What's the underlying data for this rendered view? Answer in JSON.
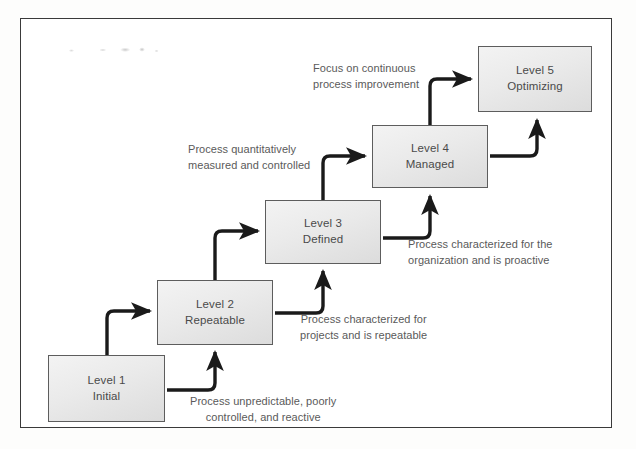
{
  "diagram": {
    "frame_color": "#3a3a3a",
    "box_fill": "#eaeaea",
    "box_border": "#5d5d5d",
    "connector_color": "#1a1a1a",
    "text_color": "#4a4a4a",
    "caption_color": "#5a5a5a"
  },
  "levels": [
    {
      "id": "level-1",
      "number": "Level 1",
      "name": "Initial",
      "x": 48,
      "y": 355,
      "w": 117,
      "h": 67
    },
    {
      "id": "level-2",
      "number": "Level 2",
      "name": "Repeatable",
      "x": 157,
      "y": 280,
      "w": 116,
      "h": 65
    },
    {
      "id": "level-3",
      "number": "Level 3",
      "name": "Defined",
      "x": 265,
      "y": 200,
      "w": 116,
      "h": 64
    },
    {
      "id": "level-4",
      "number": "Level 4",
      "name": "Managed",
      "x": 372,
      "y": 125,
      "w": 116,
      "h": 63
    },
    {
      "id": "level-5",
      "number": "Level 5",
      "name": "Optimizing",
      "x": 478,
      "y": 46,
      "w": 114,
      "h": 66
    }
  ],
  "captions": [
    {
      "id": "caption-level-1",
      "line1": "Process unpredictable, poorly",
      "line2": "controlled, and reactive",
      "x": 190,
      "y": 394,
      "align": "center"
    },
    {
      "id": "caption-level-2",
      "line1": "Process characterized for",
      "line2": "projects and is repeatable",
      "x": 300,
      "y": 312,
      "align": "center"
    },
    {
      "id": "caption-level-3",
      "line1": "Process characterized for the",
      "line2": "organization and is proactive",
      "x": 408,
      "y": 237,
      "align": "left"
    },
    {
      "id": "caption-level-4",
      "line1": "Process quantitatively",
      "line2": "measured and controlled",
      "x": 188,
      "y": 142,
      "align": "left"
    },
    {
      "id": "caption-level-5",
      "line1": "Focus on continuous",
      "line2": "process improvement",
      "x": 313,
      "y": 61,
      "align": "left"
    }
  ]
}
